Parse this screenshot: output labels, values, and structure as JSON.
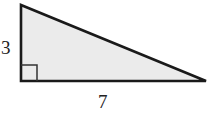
{
  "diagram": {
    "shape": "right-triangle",
    "fill_color": "#ebebeb",
    "stroke_color": "#1a1a1a",
    "labels": {
      "vertical_leg": "3",
      "horizontal_leg": "7"
    },
    "right_angle_marker": true
  }
}
